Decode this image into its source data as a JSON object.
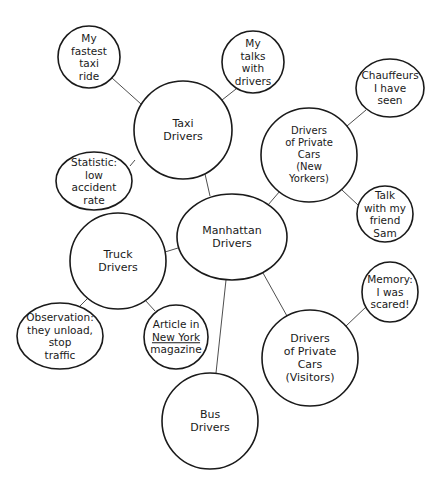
{
  "diagram": {
    "type": "cluster map",
    "colors": {
      "stroke": "#1a1a1a",
      "fill": "#ffffff",
      "background": "#ffffff"
    },
    "center": {
      "id": "manhattan",
      "lines": [
        "Manhattan",
        "Drivers"
      ]
    },
    "nodes": [
      {
        "id": "manhattan",
        "lines": [
          "Manhattan",
          "Drivers"
        ],
        "cx": 232,
        "cy": 237,
        "rx": 55,
        "ry": 43
      },
      {
        "id": "taxi",
        "lines": [
          "Taxi",
          "Drivers"
        ],
        "cx": 183,
        "cy": 130,
        "rx": 49,
        "ry": 49
      },
      {
        "id": "fastest",
        "lines": [
          "My",
          "fastest",
          "taxi",
          "ride"
        ],
        "cx": 89,
        "cy": 57,
        "rx": 31,
        "ry": 31
      },
      {
        "id": "talks",
        "lines": [
          "My",
          "talks",
          "with",
          "drivers"
        ],
        "cx": 253,
        "cy": 62,
        "rx": 31,
        "ry": 31
      },
      {
        "id": "statistic",
        "lines": [
          "Statistic:",
          "low",
          "accident",
          "rate"
        ],
        "cx": 94,
        "cy": 181,
        "rx": 38,
        "ry": 29
      },
      {
        "id": "private_ny",
        "lines": [
          "Drivers",
          "of Private",
          "Cars",
          "(New",
          "Yorkers)"
        ],
        "cx": 309,
        "cy": 155,
        "rx": 48,
        "ry": 47
      },
      {
        "id": "chauffeurs",
        "lines": [
          "Chauffeurs",
          "I have",
          "seen"
        ],
        "cx": 390,
        "cy": 88,
        "rx": 34,
        "ry": 29
      },
      {
        "id": "sam",
        "lines": [
          "Talk",
          "with my",
          "friend",
          "Sam"
        ],
        "cx": 385,
        "cy": 214,
        "rx": 28,
        "ry": 28
      },
      {
        "id": "truck",
        "lines": [
          "Truck",
          "Drivers"
        ],
        "cx": 118,
        "cy": 261,
        "rx": 48,
        "ry": 48
      },
      {
        "id": "observation",
        "lines": [
          "Observation:",
          "they unload,",
          "stop",
          "traffic"
        ],
        "cx": 60,
        "cy": 336,
        "rx": 43,
        "ry": 33
      },
      {
        "id": "article",
        "lines": [
          "Article in",
          "New York",
          "magazine"
        ],
        "underline_line": 1,
        "cx": 176,
        "cy": 337,
        "rx": 32,
        "ry": 32
      },
      {
        "id": "private_visitors",
        "lines": [
          "Drivers",
          "of Private",
          "Cars",
          "(Visitors)"
        ],
        "cx": 310,
        "cy": 358,
        "rx": 48,
        "ry": 48
      },
      {
        "id": "memory",
        "lines": [
          "Memory:",
          "I was",
          "scared!"
        ],
        "cx": 390,
        "cy": 292,
        "rx": 28,
        "ry": 30
      },
      {
        "id": "bus",
        "lines": [
          "Bus",
          "Drivers"
        ],
        "cx": 210,
        "cy": 421,
        "rx": 48,
        "ry": 48
      }
    ],
    "edges": [
      {
        "from": "manhattan",
        "to": "taxi",
        "x1": 210,
        "y1": 196,
        "x2": 205,
        "y2": 174
      },
      {
        "from": "manhattan",
        "to": "private_ny",
        "x1": 268,
        "y1": 205,
        "x2": 280,
        "y2": 191
      },
      {
        "from": "manhattan",
        "to": "truck",
        "x1": 178,
        "y1": 248,
        "x2": 165,
        "y2": 252
      },
      {
        "from": "manhattan",
        "to": "private_visitors",
        "x1": 263,
        "y1": 273,
        "x2": 287,
        "y2": 316
      },
      {
        "from": "manhattan",
        "to": "bus",
        "x1": 226,
        "y1": 280,
        "x2": 216,
        "y2": 373
      },
      {
        "from": "taxi",
        "to": "fastest",
        "x1": 141,
        "y1": 104,
        "x2": 112,
        "y2": 78
      },
      {
        "from": "taxi",
        "to": "talks",
        "x1": 222,
        "y1": 100,
        "x2": 236,
        "y2": 89
      },
      {
        "from": "taxi",
        "to": "statistic",
        "x1": 135,
        "y1": 160,
        "x2": 130,
        "y2": 166
      },
      {
        "from": "private_ny",
        "to": "chauffeurs",
        "x1": 347,
        "y1": 126,
        "x2": 366,
        "y2": 110
      },
      {
        "from": "private_ny",
        "to": "sam",
        "x1": 342,
        "y1": 190,
        "x2": 358,
        "y2": 205
      },
      {
        "from": "truck",
        "to": "observation",
        "x1": 88,
        "y1": 298,
        "x2": 79,
        "y2": 307
      },
      {
        "from": "truck",
        "to": "article",
        "x1": 145,
        "y1": 300,
        "x2": 155,
        "y2": 311
      },
      {
        "from": "private_visitors",
        "to": "memory",
        "x1": 346,
        "y1": 326,
        "x2": 367,
        "y2": 306
      }
    ]
  }
}
